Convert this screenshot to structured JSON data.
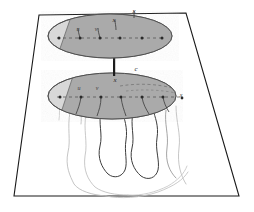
{
  "figure": {
    "background_color": "#ffffff",
    "frame": {
      "name": "trapezoid-frame",
      "stroke_color": "#1a1a1a",
      "top_left": [
        39,
        15
      ],
      "top_right": [
        186,
        13
      ],
      "bottom_right": [
        239,
        196
      ],
      "bottom_left": [
        14,
        196
      ]
    },
    "colors": {
      "ellipse_dark_fill": "#a8a8a8",
      "ellipse_light_fill": "#d8d8d8",
      "ellipse_stroke": "#585858",
      "dot_color": "#2a2a2a",
      "dashed_line": "#4a4a4a",
      "connector_rod": "#1c1c1c",
      "wavy_dark": "#3c3c3c",
      "wavy_light": "#b0b0b0"
    },
    "upper_plane": {
      "name": "upper-ellipse-plane",
      "center": [
        110,
        36
      ],
      "radius_x": 62,
      "radius_y": 22,
      "labels": [
        {
          "text": "u",
          "x": 78,
          "y": 31
        },
        {
          "text": "v",
          "x": 96,
          "y": 31
        },
        {
          "text": "x",
          "x": 114,
          "y": 22
        },
        {
          "text": "x",
          "x": 134,
          "y": 14
        }
      ],
      "dots": [
        {
          "x": 59,
          "y": 38
        },
        {
          "x": 80,
          "y": 38
        },
        {
          "x": 100,
          "y": 38
        },
        {
          "x": 120,
          "y": 38
        },
        {
          "x": 142,
          "y": 38
        },
        {
          "x": 162,
          "y": 38
        }
      ],
      "dot_count": 6
    },
    "lower_plane": {
      "name": "lower-ellipse-plane",
      "center": [
        112,
        96
      ],
      "radius_x": 64,
      "radius_y": 23,
      "labels": [
        {
          "text": "u",
          "x": 79,
          "y": 90
        },
        {
          "text": "v",
          "x": 97,
          "y": 90
        },
        {
          "text": "x",
          "x": 115,
          "y": 82
        },
        {
          "text": "c",
          "x": 136,
          "y": 71
        },
        {
          "text": "x",
          "x": 181,
          "y": 97
        }
      ],
      "dots": [
        {
          "x": 60,
          "y": 97
        },
        {
          "x": 81,
          "y": 97
        },
        {
          "x": 101,
          "y": 97
        },
        {
          "x": 121,
          "y": 97
        },
        {
          "x": 142,
          "y": 97
        },
        {
          "x": 163,
          "y": 97
        },
        {
          "x": 182,
          "y": 98
        }
      ],
      "dot_count": 7
    },
    "connector": {
      "name": "vertical-connector-rod",
      "x": 114,
      "y_top": 55,
      "y_bottom": 76,
      "width": 2
    },
    "flow_lines": {
      "name": "wavy-flow-lines",
      "count": 7,
      "description": "Wavy vertical contour lines descending from the lower ellipse toward the base of the frame"
    }
  }
}
